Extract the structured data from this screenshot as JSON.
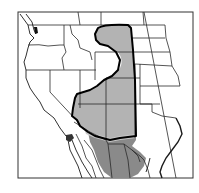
{
  "map": {
    "title": "",
    "region": "Western North America",
    "colors": {
      "background": "#ffffff",
      "range_primary": "#b3b3b3",
      "range_secondary": "#8a8a8a",
      "range_outline": "#000000",
      "borders": "#2a2a2a",
      "inset_dot": "#333333"
    },
    "legend": []
  }
}
